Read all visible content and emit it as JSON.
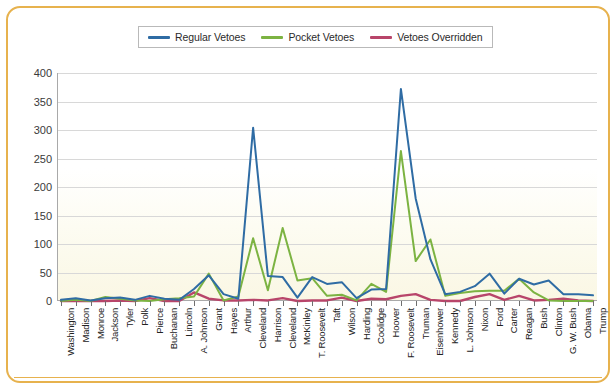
{
  "colors": {
    "regular": "#2f6ca4",
    "pocket": "#7cb342",
    "overridden": "#b8456a",
    "frame": "#e7b24e",
    "grid": "#d8d8d8",
    "axis": "#a9a9a9"
  },
  "legend": {
    "position": "top-center",
    "entries": [
      {
        "label": "Regular Vetoes",
        "color": "#2f6ca4"
      },
      {
        "label": "Pocket Vetoes",
        "color": "#7cb342"
      },
      {
        "label": "Vetoes Overridden",
        "color": "#b8456a"
      }
    ]
  },
  "yaxis": {
    "ticks": [
      "0",
      "50",
      "100",
      "150",
      "200",
      "250",
      "300",
      "350",
      "400"
    ]
  },
  "chart_data": {
    "type": "line",
    "title": "",
    "subtitle": "",
    "xlabel": "",
    "ylabel": "",
    "ylim": [
      0,
      400
    ],
    "ytick_step": 50,
    "grid": true,
    "legend_position": "top-center",
    "categories": [
      "Washington",
      "Madison",
      "Monroe",
      "Jackson",
      "Tyler",
      "Polk",
      "Pierce",
      "Buchanan",
      "Lincoln",
      "A. Johnson",
      "Grant",
      "Hayes",
      "Arthur",
      "Cleveland",
      "Harrison",
      "Cleveland",
      "McKinley",
      "T. Roosevelt",
      "Taft",
      "Wilson",
      "Harding",
      "Coolidge",
      "Hoover",
      "F. Roosevelt",
      "Truman",
      "Eisenhower",
      "Kennedy",
      "L. Johnson",
      "Nixon",
      "Ford",
      "Carter",
      "Reagan",
      "Bush",
      "Clinton",
      "G. W. Bush",
      "Obama",
      "Trump"
    ],
    "series": [
      {
        "name": "Regular Vetoes",
        "color": "#2f6ca4",
        "values": [
          2,
          5,
          1,
          5,
          6,
          2,
          9,
          4,
          2,
          21,
          45,
          12,
          4,
          304,
          44,
          42,
          6,
          42,
          30,
          33,
          5,
          20,
          21,
          372,
          180,
          73,
          12,
          16,
          26,
          48,
          13,
          39,
          29,
          36,
          12,
          12,
          10
        ]
      },
      {
        "name": "Pocket Vetoes",
        "color": "#7cb342",
        "values": [
          0,
          2,
          0,
          7,
          4,
          1,
          0,
          3,
          5,
          8,
          48,
          1,
          8,
          110,
          19,
          128,
          36,
          40,
          9,
          11,
          1,
          30,
          16,
          263,
          70,
          108,
          9,
          14,
          17,
          18,
          18,
          39,
          15,
          1,
          0,
          0,
          0
        ]
      },
      {
        "name": "Vetoes Overridden",
        "color": "#b8456a",
        "values": [
          0,
          0,
          0,
          0,
          1,
          0,
          5,
          0,
          0,
          15,
          4,
          1,
          1,
          2,
          1,
          5,
          0,
          1,
          1,
          6,
          0,
          4,
          3,
          9,
          12,
          2,
          0,
          0,
          7,
          12,
          2,
          9,
          1,
          2,
          4,
          1,
          0
        ]
      }
    ]
  }
}
